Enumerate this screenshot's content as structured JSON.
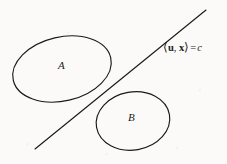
{
  "figure": {
    "background_color": "#fbfaf8",
    "stroke_color": "#1a1a1a",
    "width": 227,
    "height": 164,
    "label_A": "A",
    "label_B": "B",
    "hyperplane": {
      "bracket_open": "⟨",
      "vector_u": "u",
      "comma": ",",
      "vector_x": "x",
      "bracket_close": "⟩",
      "equals": "=",
      "constant": "c",
      "full_text": "⟨u, x⟩ = c"
    }
  },
  "chart_data": {
    "type": "diagram",
    "elements": [
      {
        "name": "set-A",
        "kind": "ellipse",
        "label": "A",
        "center": [
          62,
          69
        ],
        "radius_x": 50,
        "radius_y": 32,
        "rotation_deg": -13,
        "label_position": [
          62,
          65
        ]
      },
      {
        "name": "set-B",
        "kind": "ellipse",
        "label": "B",
        "center": [
          133,
          121
        ],
        "radius_x": 37,
        "radius_y": 29,
        "rotation_deg": -10,
        "label_position": [
          132,
          117
        ]
      },
      {
        "name": "separating-line",
        "kind": "line",
        "label": "⟨u, x⟩ = c",
        "start": [
          35,
          149
        ],
        "end": [
          206,
          10
        ],
        "slope": -0.813,
        "tangency_point": [
          105,
          94
        ],
        "label_position": [
          163,
          47
        ]
      }
    ],
    "annotations": [
      {
        "text": "A",
        "position": [
          62,
          65
        ],
        "style": "italic-serif"
      },
      {
        "text": "B",
        "position": [
          132,
          117
        ],
        "style": "italic-serif"
      },
      {
        "text": "⟨u, x⟩ = c",
        "position": [
          163,
          47
        ],
        "style": "serif-bold-vectors"
      }
    ],
    "grid": false,
    "legend": null
  }
}
